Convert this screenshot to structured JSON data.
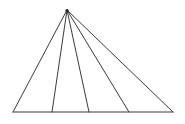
{
  "figure": {
    "background_color": "#ffffff",
    "stroke_color": "#3b3b3b",
    "stroke_width": 1,
    "canvas": {
      "width": 185,
      "height": 124
    },
    "shape_type": "triangle-fan",
    "sub_triangle_count": 4,
    "line_count": 6
  },
  "geometry": {
    "apex": {
      "name": "apex",
      "x": 67,
      "y": 10
    },
    "base_left": {
      "name": "base-left-vertex",
      "x": 13,
      "y": 112
    },
    "base_right": {
      "name": "base-right-vertex",
      "x": 173,
      "y": 112
    },
    "base_points": [
      {
        "name": "base-point-1",
        "x": 52,
        "y": 112
      },
      {
        "name": "base-point-2",
        "x": 89,
        "y": 112
      },
      {
        "name": "base-point-3",
        "x": 129,
        "y": 112
      }
    ],
    "segments": [
      {
        "name": "left-side",
        "x1": 67,
        "y1": 10,
        "x2": 13,
        "y2": 112
      },
      {
        "name": "cevian-1",
        "x1": 67,
        "y1": 10,
        "x2": 52,
        "y2": 112
      },
      {
        "name": "cevian-2",
        "x1": 67,
        "y1": 10,
        "x2": 89,
        "y2": 112
      },
      {
        "name": "cevian-3",
        "x1": 67,
        "y1": 10,
        "x2": 129,
        "y2": 112
      },
      {
        "name": "right-side",
        "x1": 67,
        "y1": 10,
        "x2": 173,
        "y2": 112
      },
      {
        "name": "base-line",
        "x1": 13,
        "y1": 112,
        "x2": 173,
        "y2": 112
      }
    ]
  },
  "chart_data": {
    "type": "diagram",
    "labels": [],
    "annotations": []
  }
}
